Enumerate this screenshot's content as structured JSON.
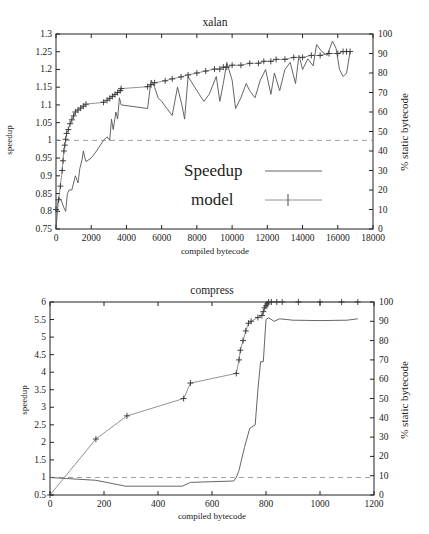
{
  "chart_data": [
    {
      "type": "line",
      "title": "xalan",
      "xlabel": "compiled bytecode",
      "ylabel": "speedup",
      "y2label": "% static bytecode",
      "xlim": [
        0,
        18000
      ],
      "ylim": [
        0.75,
        1.3
      ],
      "y2lim": [
        0,
        100
      ],
      "xticks": [
        "0",
        "2000",
        "4000",
        "6000",
        "8000",
        "10000",
        "12000",
        "14000",
        "16000",
        "18000"
      ],
      "yticks": [
        "0.75",
        "0.8",
        "0.85",
        "0.9",
        "0.95",
        "1",
        "1.05",
        "1.1",
        "1.15",
        "1.2",
        "1.25",
        "1.3"
      ],
      "y2ticks": [
        "0",
        "10",
        "20",
        "30",
        "40",
        "50",
        "60",
        "70",
        "80",
        "90",
        "100"
      ],
      "grid": false,
      "legend": {
        "position": "inside-right",
        "entries": [
          "Speedup",
          "model"
        ]
      },
      "reference_line": {
        "axis": "y",
        "value": 1.0,
        "style": "dashed"
      },
      "series": [
        {
          "name": "Speedup",
          "axis": "y",
          "x": [
            0,
            150,
            300,
            450,
            550,
            650,
            750,
            900,
            1100,
            1250,
            1350,
            1500,
            1550,
            1700,
            2000,
            2300,
            2700,
            2900,
            3050,
            3150,
            3250,
            3400,
            3500,
            3600,
            3700,
            5200,
            5400,
            5600,
            5800,
            6000,
            6300,
            6600,
            6900,
            7150,
            7300,
            7500,
            8000,
            8400,
            8700,
            9100,
            9300,
            9500,
            9700,
            10000,
            10200,
            10500,
            10800,
            11000,
            11300,
            11600,
            11900,
            12200,
            12400,
            12700,
            13000,
            13300,
            13600,
            13800,
            14000,
            14300,
            14600,
            14800,
            15100,
            15400,
            15700,
            15900,
            16100,
            16300,
            16500,
            16700
          ],
          "y": [
            0.75,
            0.84,
            0.83,
            0.81,
            0.8,
            0.85,
            0.86,
            0.86,
            0.9,
            0.88,
            0.92,
            0.95,
            0.97,
            0.94,
            0.95,
            0.97,
            1.0,
            1.01,
            1.0,
            1.06,
            1.03,
            1.08,
            1.06,
            1.12,
            1.1,
            1.09,
            1.17,
            1.15,
            1.12,
            1.11,
            1.09,
            1.07,
            1.15,
            1.1,
            1.06,
            1.18,
            1.14,
            1.11,
            1.13,
            1.18,
            1.11,
            1.16,
            1.22,
            1.17,
            1.09,
            1.12,
            1.16,
            1.14,
            1.12,
            1.17,
            1.2,
            1.13,
            1.19,
            1.14,
            1.2,
            1.22,
            1.16,
            1.24,
            1.2,
            1.23,
            1.21,
            1.27,
            1.25,
            1.24,
            1.28,
            1.26,
            1.2,
            1.18,
            1.19,
            1.25
          ]
        },
        {
          "name": "model",
          "axis": "y2",
          "x": [
            0,
            150,
            250,
            350,
            400,
            450,
            500,
            550,
            600,
            700,
            800,
            900,
            1000,
            1100,
            1250,
            1400,
            1550,
            1700,
            2700,
            2900,
            3050,
            3200,
            3350,
            3500,
            3650,
            3700,
            5200,
            5400,
            5600,
            6200,
            6600,
            7100,
            7500,
            8000,
            8500,
            9000,
            9300,
            9500,
            9700,
            10000,
            10500,
            11000,
            11500,
            11800,
            12200,
            12500,
            13000,
            13500,
            14000,
            14500,
            15000,
            15500,
            16000,
            16300,
            16500,
            16700
          ],
          "y": [
            10,
            15,
            22,
            30,
            35,
            40,
            43,
            46,
            49,
            51,
            54,
            56,
            58,
            60,
            61,
            62,
            63,
            64,
            65,
            66,
            67,
            68,
            69,
            70,
            71,
            72,
            73,
            74,
            75,
            76,
            77,
            78,
            79,
            80,
            81,
            82,
            82,
            83,
            83,
            84,
            84,
            85,
            85,
            86,
            86,
            87,
            87,
            88,
            88,
            89,
            89,
            90,
            90,
            91,
            91,
            91
          ]
        }
      ]
    },
    {
      "type": "line",
      "title": "compress",
      "xlabel": "compiled bytecode",
      "ylabel": "speedup",
      "y2label": "% static bytecode",
      "xlim": [
        0,
        1200
      ],
      "ylim": [
        0.5,
        6
      ],
      "y2lim": [
        0,
        100
      ],
      "xticks": [
        "0",
        "200",
        "400",
        "600",
        "800",
        "1000",
        "1200"
      ],
      "yticks": [
        "0.5",
        "1",
        "1.5",
        "2",
        "2.5",
        "3",
        "3.5",
        "4",
        "4.5",
        "5",
        "5.5",
        "6"
      ],
      "y2ticks": [
        "0",
        "10",
        "20",
        "30",
        "40",
        "50",
        "60",
        "70",
        "80",
        "90",
        "100"
      ],
      "grid": false,
      "reference_line": {
        "axis": "y",
        "value": 1.0,
        "style": "dashed"
      },
      "series": [
        {
          "name": "Speedup",
          "axis": "y",
          "x": [
            0,
            60,
            170,
            280,
            400,
            490,
            520,
            600,
            680,
            690,
            700,
            720,
            740,
            760,
            770,
            780,
            790,
            800,
            810,
            830,
            850,
            900,
            1000,
            1100,
            1140
          ],
          "y": [
            1.0,
            0.97,
            0.92,
            0.75,
            0.75,
            0.75,
            0.86,
            0.88,
            0.9,
            1.0,
            1.2,
            1.85,
            2.4,
            2.5,
            3.5,
            4.3,
            4.3,
            5.5,
            5.55,
            5.45,
            5.52,
            5.48,
            5.47,
            5.48,
            5.52
          ],
          "y_pct_note": "plotted against left axis"
        },
        {
          "name": "model",
          "axis": "y2",
          "x": [
            0,
            170,
            285,
            495,
            520,
            690,
            700,
            705,
            715,
            725,
            735,
            745,
            770,
            785,
            790,
            795,
            800,
            805,
            810,
            820,
            840,
            860,
            920,
            1000,
            1080,
            1140
          ],
          "y": [
            0,
            29,
            41,
            50,
            58,
            63,
            70,
            75,
            80,
            85,
            89,
            90,
            92,
            93,
            95,
            97,
            98,
            99,
            100,
            100,
            100,
            100,
            100,
            100,
            100,
            100
          ]
        }
      ]
    }
  ],
  "charts": {
    "top": {
      "title": "xalan",
      "xlabel": "compiled bytecode",
      "ylabel": "speedup",
      "y2label": "% static bytecode",
      "legend_speedup": "Speedup",
      "legend_model": "model"
    },
    "bottom": {
      "title": "compress",
      "xlabel": "compiled bytecode",
      "ylabel": "speedup",
      "y2label": "% static bytecode"
    }
  }
}
